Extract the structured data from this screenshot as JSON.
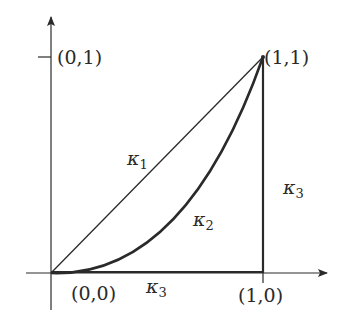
{
  "diagram": {
    "axes": {
      "x_axis": {
        "arrow": true
      },
      "y_axis": {
        "arrow": true
      }
    },
    "points": [
      {
        "id": "origin",
        "label": "(0,0)",
        "x": 0,
        "y": 0
      },
      {
        "id": "x1",
        "label": "(1,0)",
        "x": 1,
        "y": 0
      },
      {
        "id": "y1",
        "label": "(0,1)",
        "x": 0,
        "y": 1
      },
      {
        "id": "corner",
        "label": "(1,1)",
        "x": 1,
        "y": 1
      }
    ],
    "curves": [
      {
        "id": "kappa1",
        "symbol": "κ",
        "subscript": "1",
        "shape": "straight line from (0,0) to (1,1)"
      },
      {
        "id": "kappa2",
        "symbol": "κ",
        "subscript": "2",
        "shape": "convex curve from (0,0) to (1,1)"
      },
      {
        "id": "kappa3",
        "symbol": "κ",
        "subscript": "3",
        "shape": "path (0,0) → (1,0) → (1,1)"
      }
    ],
    "labels": {
      "p00": "(0,0)",
      "p10": "(1,0)",
      "p01": "(0,1)",
      "p11": "(1,1)",
      "k1_sym": "κ",
      "k1_sub": "1",
      "k2_sym": "κ",
      "k2_sub": "2",
      "k3a_sym": "κ",
      "k3a_sub": "3",
      "k3b_sym": "κ",
      "k3b_sub": "3"
    },
    "colors": {
      "ink": "#2a2a2a"
    }
  }
}
